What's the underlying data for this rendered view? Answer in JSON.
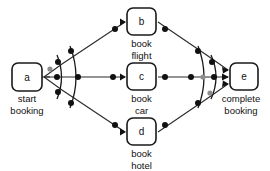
{
  "diagram": {
    "background_color": "#ffffff",
    "node_stroke_color": "#1a1a1a",
    "edge_color": "#2b2b2b",
    "dot_color": "#111111",
    "gray_dot_color": "#8d8d8d",
    "nodes": [
      {
        "id": "a",
        "letter": "a",
        "label_line1": "start",
        "label_line2": "booking",
        "x": 12,
        "y": 63,
        "w": 30,
        "h": 28
      },
      {
        "id": "b",
        "letter": "b",
        "label_line1": "book",
        "label_line2": "flight",
        "x": 127,
        "y": 8,
        "w": 29,
        "h": 27
      },
      {
        "id": "c",
        "letter": "c",
        "label_line1": "book",
        "label_line2": "car",
        "x": 127,
        "y": 63,
        "w": 29,
        "h": 27
      },
      {
        "id": "d",
        "letter": "d",
        "label_line1": "book",
        "label_line2": "hotel",
        "x": 127,
        "y": 118,
        "w": 29,
        "h": 27
      },
      {
        "id": "e",
        "letter": "e",
        "label_line1": "complete",
        "label_line2": "booking",
        "x": 230,
        "y": 63,
        "w": 28,
        "h": 27
      }
    ],
    "edges": [
      {
        "from": "a",
        "to": "b",
        "kind": "split-branch"
      },
      {
        "from": "a",
        "to": "c",
        "kind": "split-branch"
      },
      {
        "from": "a",
        "to": "d",
        "kind": "split-branch"
      },
      {
        "from": "b",
        "to": "e",
        "kind": "join-branch"
      },
      {
        "from": "c",
        "to": "e",
        "kind": "join-branch"
      },
      {
        "from": "d",
        "to": "e",
        "kind": "join-branch"
      }
    ],
    "split_gateway": {
      "name": "and-split-arcs",
      "arc_count": 2,
      "anchor_x": 44,
      "anchor_y": 77
    },
    "join_gateway": {
      "name": "and-join-arcs",
      "arc_count": 2,
      "anchor_x": 228,
      "anchor_y": 77
    }
  }
}
